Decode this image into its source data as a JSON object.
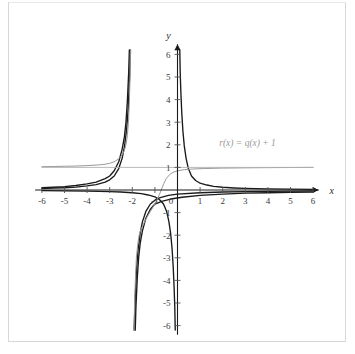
{
  "figure": {
    "title": "",
    "background_color": "#ffffff",
    "frame_color": "#d8d8d8"
  },
  "axes": {
    "x_axis_name": "x",
    "y_axis_name": "y",
    "origin_label": "0",
    "x_ticks": [
      "-6",
      "-5",
      "-4",
      "-3",
      "-2",
      "-1",
      "1",
      "2",
      "3",
      "4",
      "5",
      "6"
    ],
    "y_ticks": [
      "6",
      "5",
      "4",
      "3",
      "2",
      "1",
      "-1",
      "-2",
      "-3",
      "-4",
      "-5",
      "-6"
    ],
    "axis_color": "#1a1a1a",
    "tick_color": "#555555"
  },
  "annotations": {
    "r_label": "r(x) = q(x) + 1",
    "r_label_color": "#9a9a9a"
  },
  "chart_data": {
    "type": "line",
    "title": "",
    "xlabel": "x",
    "ylabel": "y",
    "xlim": [
      -6,
      6
    ],
    "ylim": [
      -6,
      6
    ],
    "grid": false,
    "legend": "none",
    "xticks": [
      -6,
      -5,
      -4,
      -3,
      -2,
      -1,
      0,
      1,
      2,
      3,
      4,
      5,
      6
    ],
    "yticks": [
      -6,
      -5,
      -4,
      -3,
      -2,
      -1,
      0,
      1,
      2,
      3,
      4,
      5,
      6
    ],
    "annotations": [
      {
        "text": "r(x) = q(x) + 1",
        "x": 3.1,
        "y": 1.95,
        "color": "#9a9a9a"
      }
    ],
    "series": [
      {
        "name": "p(x)",
        "color": "#1a1a1a",
        "style": "solid",
        "vertical_asymptotes": [
          -2
        ],
        "horizontal_asymptote": 0,
        "description": "steep rational curve with vertical asymptote at x = -2, approaching y = 0 on both ends",
        "points": [
          [
            -6,
            0.06
          ],
          [
            -5.5,
            0.08
          ],
          [
            -5,
            0.1
          ],
          [
            -4.5,
            0.13
          ],
          [
            -4,
            0.18
          ],
          [
            -3.6,
            0.24
          ],
          [
            -3.2,
            0.35
          ],
          [
            -3,
            0.45
          ],
          [
            -2.8,
            0.62
          ],
          [
            -2.6,
            0.95
          ],
          [
            -2.45,
            1.4
          ],
          [
            -2.35,
            1.9
          ],
          [
            -2.25,
            2.7
          ],
          [
            -2.18,
            3.6
          ],
          [
            -2.12,
            5.0
          ],
          [
            -2.08,
            6.2
          ],
          [
            -1.92,
            -6.2
          ],
          [
            -1.88,
            -5.0
          ],
          [
            -1.82,
            -3.6
          ],
          [
            -1.75,
            -2.7
          ],
          [
            -1.65,
            -1.9
          ],
          [
            -1.55,
            -1.4
          ],
          [
            -1.4,
            -0.95
          ],
          [
            -1.2,
            -0.62
          ],
          [
            -1.0,
            -0.45
          ],
          [
            -0.8,
            -0.35
          ],
          [
            -0.4,
            -0.24
          ],
          [
            0,
            -0.18
          ],
          [
            1,
            -0.12
          ],
          [
            2,
            -0.09
          ],
          [
            3,
            -0.07
          ],
          [
            4,
            -0.06
          ],
          [
            5,
            -0.05
          ],
          [
            6,
            -0.04
          ]
        ]
      },
      {
        "name": "p2(x)",
        "color": "#1a1a1a",
        "style": "solid",
        "vertical_asymptotes": [
          -2
        ],
        "horizontal_asymptote": 0,
        "description": "second rational curve, slightly wider, vertical asymptote at x = -2",
        "points": [
          [
            -6,
            0.1
          ],
          [
            -5.5,
            0.12
          ],
          [
            -5,
            0.15
          ],
          [
            -4.5,
            0.2
          ],
          [
            -4,
            0.27
          ],
          [
            -3.6,
            0.35
          ],
          [
            -3.2,
            0.5
          ],
          [
            -3,
            0.62
          ],
          [
            -2.8,
            0.85
          ],
          [
            -2.6,
            1.25
          ],
          [
            -2.45,
            1.8
          ],
          [
            -2.35,
            2.35
          ],
          [
            -2.28,
            3.0
          ],
          [
            -2.22,
            3.9
          ],
          [
            -2.16,
            5.2
          ],
          [
            -2.13,
            6.2
          ],
          [
            -1.87,
            -6.2
          ],
          [
            -1.84,
            -5.2
          ],
          [
            -1.78,
            -3.9
          ],
          [
            -1.72,
            -3.0
          ],
          [
            -1.65,
            -2.35
          ],
          [
            -1.55,
            -1.8
          ],
          [
            -1.4,
            -1.25
          ],
          [
            -1.2,
            -0.85
          ],
          [
            -1.0,
            -0.62
          ],
          [
            -0.7,
            -0.5
          ],
          [
            -0.3,
            -0.4
          ],
          [
            0.2,
            -0.32
          ],
          [
            1,
            -0.24
          ],
          [
            2,
            -0.18
          ],
          [
            3,
            -0.14
          ],
          [
            4,
            -0.12
          ],
          [
            5,
            -0.1
          ],
          [
            6,
            -0.09
          ]
        ]
      },
      {
        "name": "q(x)",
        "color": "#1a1a1a",
        "style": "solid",
        "vertical_asymptotes": [
          0
        ],
        "horizontal_asymptote": 0,
        "description": "rational curve with vertical asymptote at x = 0, branches up-right and down-left",
        "points": [
          [
            -6,
            -0.03
          ],
          [
            -5,
            -0.04
          ],
          [
            -4,
            -0.05
          ],
          [
            -3,
            -0.07
          ],
          [
            -2.5,
            -0.09
          ],
          [
            -2,
            -0.12
          ],
          [
            -1.6,
            -0.16
          ],
          [
            -1.3,
            -0.22
          ],
          [
            -1.0,
            -0.3
          ],
          [
            -0.8,
            -0.42
          ],
          [
            -0.62,
            -0.62
          ],
          [
            -0.48,
            -0.95
          ],
          [
            -0.38,
            -1.4
          ],
          [
            -0.3,
            -1.95
          ],
          [
            -0.24,
            -2.6
          ],
          [
            -0.19,
            -3.4
          ],
          [
            -0.15,
            -4.3
          ],
          [
            -0.12,
            -5.2
          ],
          [
            -0.1,
            -6.2
          ],
          [
            0.1,
            6.2
          ],
          [
            0.12,
            5.2
          ],
          [
            0.15,
            4.3
          ],
          [
            0.19,
            3.4
          ],
          [
            0.24,
            2.6
          ],
          [
            0.3,
            1.95
          ],
          [
            0.38,
            1.4
          ],
          [
            0.48,
            0.95
          ],
          [
            0.62,
            0.62
          ],
          [
            0.8,
            0.42
          ],
          [
            1.0,
            0.3
          ],
          [
            1.3,
            0.22
          ],
          [
            1.6,
            0.16
          ],
          [
            2,
            0.12
          ],
          [
            2.5,
            0.09
          ],
          [
            3,
            0.07
          ],
          [
            4,
            0.05
          ],
          [
            5,
            0.04
          ],
          [
            6,
            0.03
          ]
        ]
      },
      {
        "name": "r(x) = q(x) + 1",
        "color": "#999999",
        "style": "solid",
        "vertical_asymptotes": [
          -2
        ],
        "horizontal_asymptote": 1,
        "description": "gray curve shifted up by 1 unit; horizontal asymptote y = 1",
        "points": [
          [
            -6,
            1.03
          ],
          [
            -5.5,
            1.04
          ],
          [
            -5,
            1.05
          ],
          [
            -4.5,
            1.06
          ],
          [
            -4,
            1.08
          ],
          [
            -3.5,
            1.11
          ],
          [
            -3.2,
            1.14
          ],
          [
            -3,
            1.18
          ],
          [
            -2.8,
            1.25
          ],
          [
            -2.6,
            1.38
          ],
          [
            -2.45,
            1.55
          ],
          [
            -2.35,
            1.75
          ],
          [
            -2.28,
            2.0
          ],
          [
            -2.22,
            2.4
          ],
          [
            -2.17,
            3.0
          ],
          [
            -2.13,
            3.9
          ],
          [
            -2.1,
            5.0
          ],
          [
            -2.08,
            6.2
          ],
          [
            -1.92,
            -6.2
          ],
          [
            -1.9,
            -5.0
          ],
          [
            -1.86,
            -3.9
          ],
          [
            -1.82,
            -3.0
          ],
          [
            -1.76,
            -2.4
          ],
          [
            -1.7,
            -2.0
          ],
          [
            -1.62,
            -1.75
          ],
          [
            -1.5,
            -1.5
          ],
          [
            -1.35,
            -1.2
          ],
          [
            -1.2,
            -0.95
          ],
          [
            -1.05,
            -0.7
          ],
          [
            -0.92,
            -0.45
          ],
          [
            -0.8,
            -0.2
          ],
          [
            -0.7,
            0.05
          ],
          [
            -0.6,
            0.3
          ],
          [
            -0.5,
            0.5
          ],
          [
            -0.35,
            0.68
          ],
          [
            -0.2,
            0.78
          ],
          [
            0,
            0.85
          ],
          [
            0.3,
            0.9
          ],
          [
            0.7,
            0.93
          ],
          [
            1.2,
            0.95
          ],
          [
            2,
            0.97
          ],
          [
            3,
            0.98
          ],
          [
            4,
            0.99
          ],
          [
            5,
            0.995
          ],
          [
            6,
            1.0
          ]
        ]
      },
      {
        "name": "gray-horizontal-asymptote",
        "color": "#b0b0b0",
        "style": "solid",
        "description": "light gray horizontal line at y = 1 across the full plot",
        "points": [
          [
            -6,
            1.0
          ],
          [
            6,
            1.0
          ]
        ]
      }
    ]
  }
}
